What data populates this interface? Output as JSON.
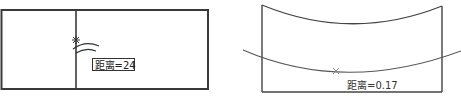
{
  "figures": [
    {
      "id": "left",
      "label": "距离=24",
      "label_boxed": true,
      "marker": "star",
      "colors": {
        "stroke": "#3a3a3a",
        "label_text": "#222222"
      }
    },
    {
      "id": "right",
      "label": "距离=0.17",
      "label_boxed": false,
      "marker": "cross",
      "colors": {
        "stroke": "#444444",
        "curve": "#555555",
        "label_text": "#333333"
      }
    }
  ]
}
